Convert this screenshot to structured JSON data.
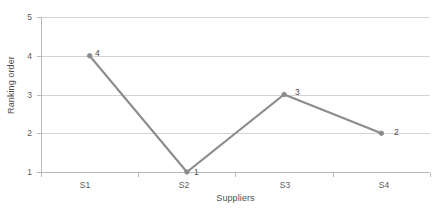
{
  "chart_data": {
    "type": "line",
    "title": "",
    "xlabel": "Suppliers",
    "ylabel": "Ranking order",
    "categories": [
      "S1",
      "S2",
      "S3",
      "S4"
    ],
    "values": [
      4,
      1,
      3,
      2
    ],
    "data_labels": [
      "4",
      "1",
      "3",
      "2"
    ],
    "series": [
      {
        "name": "Ranking order",
        "values": [
          4,
          1,
          3,
          2
        ]
      }
    ],
    "ylim": [
      1,
      5
    ],
    "y_ticks": [
      "1",
      "2",
      "3",
      "4",
      "5"
    ],
    "grid": true,
    "legend": "none",
    "marker": "round",
    "colors": {
      "line": "#8c8c8c",
      "marker": "#8c8c8c",
      "gridline": "#d4d4d4",
      "axis": "#b9b9b9",
      "text": "#4f4f4f",
      "background": "#ffffff"
    }
  },
  "axes": {
    "y_title": "Ranking order",
    "x_title": "Suppliers",
    "y_tick_labels": [
      "5",
      "4",
      "3",
      "2",
      "1"
    ],
    "x_tick_labels": [
      "S1",
      "S2",
      "S3",
      "S4"
    ]
  }
}
